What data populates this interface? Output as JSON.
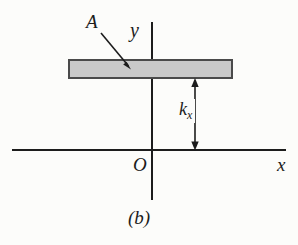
{
  "figure": {
    "caption": "(b)",
    "background_color": "#fcfcfa",
    "line_color": "#1c1c1c",
    "labels": {
      "region_label": "A",
      "y_axis": "y",
      "x_axis": "x",
      "origin": "O",
      "distance_base": "k",
      "distance_subscript": "x"
    },
    "axes": {
      "x_axis": {
        "y": 150,
        "x_start": 12,
        "x_end": 286
      },
      "y_axis": {
        "x": 152,
        "y_start": 22,
        "y_end": 200
      },
      "origin": {
        "x": 152,
        "y": 150
      }
    },
    "shaded_bar": {
      "name": "region-A",
      "x": 68,
      "y": 59,
      "width": 164,
      "height": 19,
      "fill": "#c9c9c9",
      "stroke": "#4a4a4a",
      "stroke_width": 2
    },
    "leader_line": {
      "name": "label-A-leader",
      "x1": 101,
      "y1": 33,
      "x2": 131,
      "y2": 69
    },
    "dimension_arrow": {
      "name": "kx-dimension",
      "x": 195,
      "y_top": 79,
      "y_bottom": 150,
      "double_headed": true
    }
  }
}
